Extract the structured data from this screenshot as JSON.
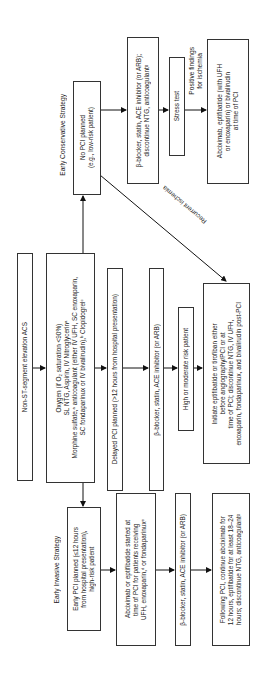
{
  "diagram": {
    "type": "flowchart",
    "orientation": "rotated-90-ccw",
    "root": {
      "text": "Non-ST-segment elevation ACS"
    },
    "initial_treatment": {
      "text": "Oxygen (if O₂ saturation <90%)\nSL NTG, Aspirin, IV Nitroglycerinᵃ\nMorphine sulfate,ᵃ anticoagulant (either IV UFH, SC enoxaparin,\nSC fondaparinux or IV bivalirudin),ᵇ Clopidogrelᶜ"
    },
    "conservative": {
      "heading": "Early Conservative Strategy",
      "start": "No PCI planned\n(e.g., low-risk patient)",
      "step1": "β-blocker, statin, ACE inhibitor (or ARB);\ndiscontinue NTG, anticoagulantᵍ",
      "step2": "Stress test",
      "edge_label": "Positive findings\nfor ischemia",
      "step3": "Abciximab, eptifibatide (with UFH\nor enoxaparin) or bivalirudin\nat time of PCI",
      "recurrent_label": "Recurrent ischemia"
    },
    "delayed": {
      "start": "Delayed PCI planned (>12 hours from hospital presentation)",
      "step1": "β-blocker, statin, ACE inhibitor (or ARB)",
      "step2": "High or moderate risk patient",
      "step3": "Initiate eptifibatide or tirofiban either\nbefore angiography/PCI or at\ntime of PCI; discontinue NTG, IV UFH,\nenoxaparin, fondaparinux, and bivalirudin post-PCI"
    },
    "invasive": {
      "heading": "Early Invasive Strategy",
      "start": "Early PCI planned (≤12 hours\nfrom hospital presentation),\nhigh-risk patient",
      "step1": "Abciximab or eptifibatide started at\ntime of PCI for patients receiving\nUFH, enoxaparin,ᵈ or fondaparinuxᵉ",
      "step2": "β-blocker, statin, ACE inhibitor (or ARB)",
      "step3": "Following PCI, continue abciximab for\n12 hours, eptifibatide for at least 18–24\nhours; discontinue NTG, anticoagulantᵍ"
    }
  }
}
